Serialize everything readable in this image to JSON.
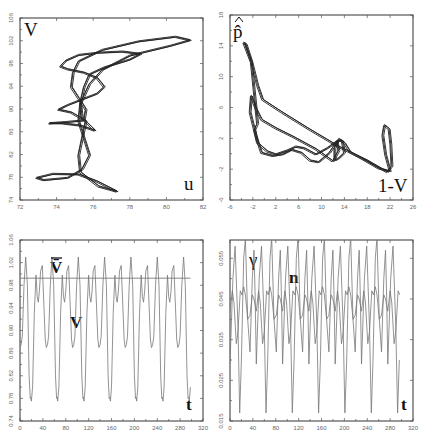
{
  "chart_data": [
    {
      "id": "uV",
      "type": "line",
      "subtype": "phase-portrait",
      "xlabel": "u",
      "ylabel": "V",
      "xlim": [
        72,
        82
      ],
      "ylim": [
        74,
        106
      ],
      "xticks": [
        72,
        74,
        76,
        78,
        80,
        82
      ],
      "yticks": [
        74,
        78,
        82,
        86,
        90,
        94,
        98,
        102,
        106
      ],
      "grid": false,
      "series": [
        {
          "name": "trajectory",
          "points": [
            [
              75.2,
              98.5
            ],
            [
              76.5,
              100.5
            ],
            [
              78.5,
              102
            ],
            [
              80.5,
              102.8
            ],
            [
              81.3,
              102.2
            ],
            [
              80.2,
              101.2
            ],
            [
              78,
              99.5
            ],
            [
              76.5,
              97
            ],
            [
              75.8,
              94.5
            ],
            [
              75.3,
              91
            ],
            [
              75.2,
              88
            ],
            [
              75.5,
              85
            ],
            [
              75.8,
              82
            ],
            [
              75.4,
              79.5
            ],
            [
              74.6,
              78
            ],
            [
              73.3,
              77.6
            ],
            [
              72.9,
              78
            ],
            [
              73.8,
              78.7
            ],
            [
              75.2,
              78.6
            ],
            [
              76.2,
              77.4
            ],
            [
              77.3,
              75.6
            ],
            [
              76.3,
              76.5
            ],
            [
              75.3,
              79
            ],
            [
              75.2,
              82
            ],
            [
              75.4,
              85
            ],
            [
              75.6,
              88
            ],
            [
              74.8,
              89.5
            ],
            [
              74.1,
              90
            ],
            [
              74.6,
              90.8
            ],
            [
              75.4,
              91.8
            ],
            [
              76.2,
              92.8
            ],
            [
              76.6,
              94
            ],
            [
              76.2,
              95.6
            ],
            [
              75.5,
              96.5
            ],
            [
              74.6,
              97.1
            ],
            [
              74.2,
              97.6
            ],
            [
              74.5,
              98.6
            ],
            [
              75.2,
              99.6
            ],
            [
              76.3,
              100
            ],
            [
              77.6,
              100.2
            ],
            [
              78.6,
              99.8
            ],
            [
              78,
              98.8
            ],
            [
              76.6,
              97.4
            ],
            [
              75.8,
              96.2
            ],
            [
              75.5,
              94
            ],
            [
              75.3,
              91.2
            ],
            [
              75.4,
              88.5
            ],
            [
              76.1,
              86.3
            ],
            [
              75.3,
              87.2
            ],
            [
              74.3,
              87.6
            ],
            [
              73.6,
              87.6
            ],
            [
              74.5,
              87.8
            ],
            [
              75.5,
              88.1
            ],
            [
              75.6,
              90
            ],
            [
              75.2,
              92
            ],
            [
              74.8,
              94
            ],
            [
              74.9,
              96.5
            ],
            [
              75.2,
              98.5
            ]
          ]
        }
      ]
    },
    {
      "id": "p_hat_vs_1mV",
      "type": "line",
      "subtype": "phase-portrait",
      "xlabel": "1-V",
      "ylabel": "p̂",
      "xlim": [
        -6,
        26
      ],
      "ylim": [
        -6,
        18
      ],
      "xticks": [
        -6,
        -2,
        2,
        6,
        10,
        14,
        18,
        22,
        26
      ],
      "yticks": [
        -6,
        -2,
        2,
        6,
        10,
        14,
        18
      ],
      "grid": false,
      "series": [
        {
          "name": "trajectory",
          "points": [
            [
              -3.6,
              14.5
            ],
            [
              -3.2,
              14.3
            ],
            [
              -2.2,
              12
            ],
            [
              -1.2,
              9
            ],
            [
              -0.3,
              7.1
            ],
            [
              3,
              5.5
            ],
            [
              8,
              3.2
            ],
            [
              13,
              1
            ],
            [
              18,
              -0.8
            ],
            [
              21.5,
              -2.3
            ],
            [
              22.3,
              -1.5
            ],
            [
              22.1,
              1.3
            ],
            [
              21.8,
              3.3
            ],
            [
              21,
              3.8
            ],
            [
              20.7,
              2.5
            ],
            [
              21.2,
              0
            ],
            [
              22,
              -2.2
            ],
            [
              20,
              -1.8
            ],
            [
              17,
              -0.5
            ],
            [
              15,
              0.3
            ],
            [
              14,
              1.5
            ],
            [
              13.5,
              1.8
            ],
            [
              13,
              2
            ],
            [
              12.3,
              0.8
            ],
            [
              12.3,
              -0.8
            ],
            [
              13,
              -0.5
            ],
            [
              14,
              0.2
            ],
            [
              13.6,
              1.8
            ],
            [
              12.7,
              1.7
            ],
            [
              11.4,
              0.2
            ],
            [
              10.6,
              -0.3
            ],
            [
              9.5,
              -1
            ],
            [
              8,
              -0.8
            ],
            [
              6.5,
              0.2
            ],
            [
              4.8,
              0.6
            ],
            [
              3.2,
              0
            ],
            [
              1.5,
              -0.2
            ],
            [
              -0.5,
              0.2
            ],
            [
              -1.5,
              2.5
            ],
            [
              -2.5,
              5.5
            ],
            [
              -2.3,
              7.6
            ],
            [
              -1.5,
              6
            ],
            [
              -0.5,
              4.5
            ],
            [
              2,
              3.4
            ],
            [
              5,
              2.3
            ],
            [
              9,
              0.7
            ],
            [
              12,
              -0.9
            ],
            [
              13,
              0.5
            ],
            [
              12.7,
              1.7
            ],
            [
              11,
              0.8
            ],
            [
              9,
              0
            ],
            [
              7,
              0.8
            ],
            [
              5.5,
              1
            ],
            [
              4,
              0.5
            ],
            [
              2,
              0
            ],
            [
              0.5,
              0.4
            ],
            [
              -1.2,
              1.5
            ],
            [
              -1.7,
              3.2
            ],
            [
              -1.2,
              4
            ],
            [
              -2.3,
              12
            ],
            [
              -3.6,
              14.5
            ]
          ]
        }
      ]
    },
    {
      "id": "V_time",
      "type": "line",
      "subtype": "time-series",
      "xlabel": "t",
      "series_labels": [
        "V̄",
        "V"
      ],
      "xlim": [
        0,
        320
      ],
      "ylim": [
        0.74,
        1.06
      ],
      "xticks": [
        0,
        40,
        80,
        120,
        160,
        200,
        240,
        280,
        320
      ],
      "yticks": [
        0.74,
        0.78,
        0.82,
        0.86,
        0.9,
        0.94,
        0.98,
        1.02,
        1.06
      ],
      "grid": false,
      "reference_line": {
        "name": "V-bar",
        "value": 0.9925,
        "x_range": [
          0,
          298
        ]
      },
      "series": [
        {
          "name": "V",
          "period": 46,
          "t_end": 298,
          "keyframes": [
            [
              0,
              0.87
            ],
            [
              2,
              0.875
            ],
            [
              4,
              0.89
            ],
            [
              7,
              0.98
            ],
            [
              10,
              1.03
            ],
            [
              13,
              0.98
            ],
            [
              16,
              0.82
            ],
            [
              18,
              0.78
            ],
            [
              19,
              0.782
            ],
            [
              20,
              0.775
            ],
            [
              22,
              0.8
            ],
            [
              25,
              0.93
            ],
            [
              28,
              0.998
            ],
            [
              30,
              0.96
            ],
            [
              32,
              0.95
            ],
            [
              34,
              0.97
            ],
            [
              36,
              1.005
            ],
            [
              39,
              1.015
            ],
            [
              42,
              0.94
            ],
            [
              44,
              0.885
            ],
            [
              46,
              0.87
            ]
          ]
        }
      ]
    },
    {
      "id": "gamma_n_time",
      "type": "line",
      "subtype": "time-series",
      "xlabel": "t",
      "series_labels": [
        "γ",
        "n"
      ],
      "xlim": [
        0,
        320
      ],
      "ylim": [
        0.015,
        0.0595
      ],
      "xticks": [
        0,
        40,
        80,
        120,
        160,
        200,
        240,
        280,
        320
      ],
      "yticks": [
        0.015,
        0.025,
        0.035,
        0.045,
        0.055
      ],
      "grid": false,
      "series": [
        {
          "name": "γ",
          "period": 46,
          "t_end": 298,
          "keyframes": [
            [
              0,
              0.029
            ],
            [
              5,
              0.05
            ],
            [
              9,
              0.058
            ],
            [
              14,
              0.038
            ],
            [
              17,
              0.017
            ],
            [
              20,
              0.03
            ],
            [
              24,
              0.055
            ],
            [
              27,
              0.06
            ],
            [
              31,
              0.04
            ],
            [
              35,
              0.032
            ],
            [
              39,
              0.05
            ],
            [
              42,
              0.057
            ],
            [
              44,
              0.045
            ],
            [
              46,
              0.029
            ]
          ]
        },
        {
          "name": "n",
          "period": 46,
          "t_end": 298,
          "keyframes": [
            [
              0,
              0.042
            ],
            [
              4,
              0.047
            ],
            [
              7,
              0.044
            ],
            [
              11,
              0.034
            ],
            [
              14,
              0.037
            ],
            [
              18,
              0.047
            ],
            [
              21,
              0.046
            ],
            [
              24,
              0.048
            ],
            [
              27,
              0.046
            ],
            [
              31,
              0.04
            ],
            [
              35,
              0.041
            ],
            [
              39,
              0.046
            ],
            [
              42,
              0.045
            ],
            [
              46,
              0.042
            ]
          ]
        }
      ]
    }
  ]
}
